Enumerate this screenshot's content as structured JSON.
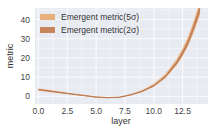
{
  "chart_data": {
    "type": "line",
    "title": "",
    "xlabel": "layer",
    "ylabel": "metric",
    "xlim": [
      -0.3,
      14.7
    ],
    "ylim": [
      -4,
      46
    ],
    "xticks": [
      0.0,
      2.5,
      5.0,
      7.5,
      10.0,
      12.5
    ],
    "xtick_labels": [
      "0.0",
      "2.5",
      "5.0",
      "7.5",
      "10.0",
      "12.5"
    ],
    "yticks": [
      0,
      10,
      20,
      30,
      40
    ],
    "ytick_labels": [
      "0",
      "10",
      "20",
      "30",
      "40"
    ],
    "grid": true,
    "legend_position": "upper left",
    "x": [
      0,
      1,
      2,
      3,
      4,
      5,
      6,
      7,
      8,
      9,
      10,
      11,
      12,
      12.5,
      13,
      13.5,
      14
    ],
    "series": [
      {
        "name": "Emergent metric(5σ)",
        "color": "#e8b07a",
        "values": [
          3.5,
          2.7,
          1.9,
          1.1,
          0.4,
          -0.4,
          -0.7,
          -0.5,
          0.8,
          2.8,
          5.8,
          10.5,
          18.0,
          23.0,
          29.0,
          37.0,
          46.0
        ]
      },
      {
        "name": "Emergent metric(2σ)",
        "color": "#c8845a",
        "values": [
          3.5,
          2.7,
          1.9,
          1.1,
          0.4,
          -0.4,
          -0.7,
          -0.5,
          0.8,
          2.6,
          5.5,
          10.2,
          17.6,
          22.6,
          28.6,
          36.6,
          45.6
        ]
      }
    ]
  },
  "legend": {
    "items": [
      {
        "label": "Emergent metric(5σ)",
        "color": "#e8b07a"
      },
      {
        "label": "Emergent metric(2σ)",
        "color": "#c8845a"
      }
    ]
  },
  "axes": {
    "xlabel": "layer",
    "ylabel": "metric",
    "xtick_labels": [
      "0.0",
      "2.5",
      "5.0",
      "7.5",
      "10.0",
      "12.5"
    ],
    "ytick_labels": [
      "0",
      "10",
      "20",
      "30",
      "40"
    ]
  },
  "colors": {
    "plot_bg": "#e9ebf2",
    "grid": "#ffffff",
    "line": "#b57550"
  }
}
